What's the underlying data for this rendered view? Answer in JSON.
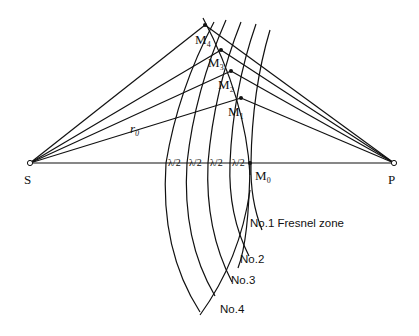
{
  "diagram": {
    "points": {
      "source": "S",
      "observer": "P",
      "m0": "M₀",
      "m1": "M₁",
      "m2": "M₂",
      "m3": "M₃",
      "m4": "M₄"
    },
    "distance_label": "r₀",
    "half_wave_labels": [
      "λ/2",
      "λ/2",
      "λ/2",
      "λ/2"
    ],
    "zone_labels": {
      "zone1": "No.1 Fresnel zone",
      "zone2": "No.2",
      "zone3": "No.3",
      "zone4": "No.4"
    },
    "colors": {
      "line": "#111111",
      "background": "#ffffff"
    }
  }
}
